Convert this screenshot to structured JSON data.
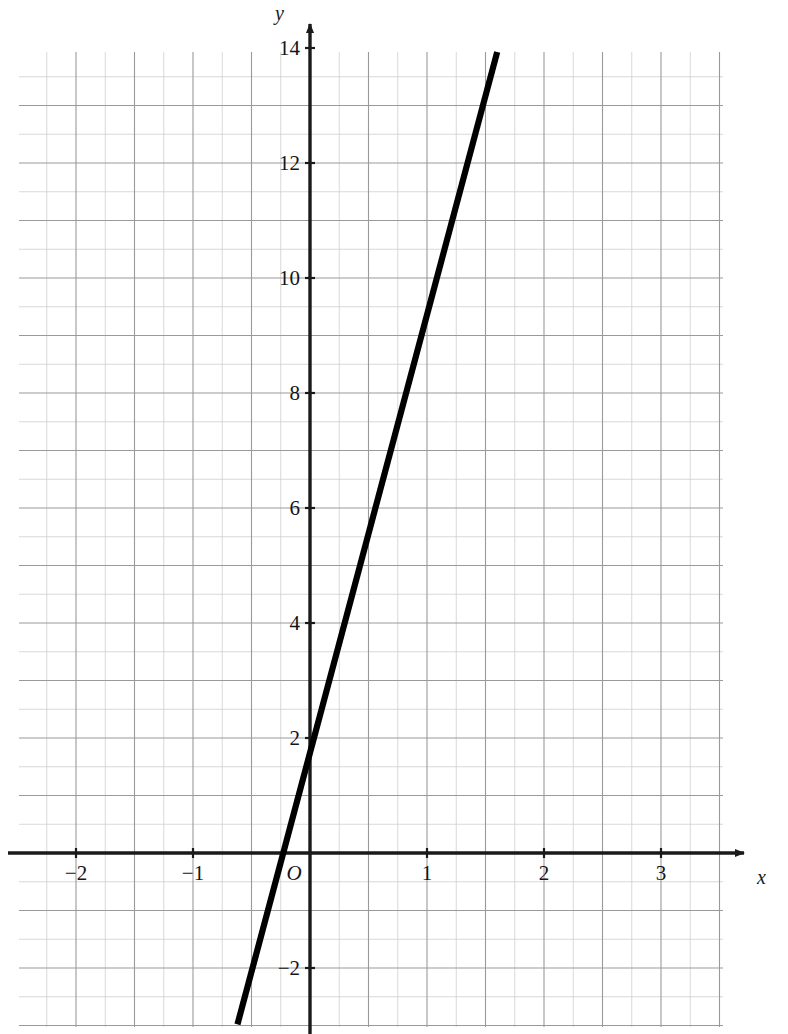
{
  "chart_data": {
    "type": "line",
    "title": "",
    "subtitle": "",
    "xlabel": "x",
    "ylabel": "y",
    "xlim": [
      -2.49,
      3.53
    ],
    "ylim": [
      -3.07,
      13.93
    ],
    "grid": true,
    "grid_major_step_x": 0.5,
    "grid_major_step_y": 1,
    "legend": "none",
    "x_ticks": [
      -2,
      -1,
      1,
      2,
      3
    ],
    "x_tick_labels": [
      "−2",
      "−1",
      "1",
      "2",
      "3"
    ],
    "y_ticks": [
      -2,
      2,
      4,
      6,
      8,
      10,
      12,
      14
    ],
    "y_tick_labels": [
      "−2",
      "2",
      "4",
      "6",
      "8",
      "10",
      "12",
      "14"
    ],
    "origin_label": "O",
    "series": [
      {
        "name": "straight line",
        "equation": "y = 8x + 2",
        "slope": 8,
        "intercept": 2,
        "color": "#000000",
        "points": [
          {
            "x": -0.62,
            "y": -2.98
          },
          {
            "x": 1.6,
            "y": 13.93
          }
        ],
        "key_points": [
          {
            "x": 0,
            "y": 2,
            "note": "y-intercept"
          },
          {
            "x": -0.25,
            "y": 0,
            "note": "x-intercept"
          },
          {
            "x": 1,
            "y": 10
          },
          {
            "x": 1.5,
            "y": 14
          }
        ]
      }
    ]
  },
  "axes": {
    "x_axis_name": "x",
    "y_axis_name": "y",
    "origin_label": "O"
  },
  "ticks": {
    "x": [
      {
        "label": "−2",
        "value": -2
      },
      {
        "label": "−1",
        "value": -1
      },
      {
        "label": "1",
        "value": 1
      },
      {
        "label": "2",
        "value": 2
      },
      {
        "label": "3",
        "value": 3
      }
    ],
    "y": [
      {
        "label": "14",
        "value": 14
      },
      {
        "label": "12",
        "value": 12
      },
      {
        "label": "10",
        "value": 10
      },
      {
        "label": "8",
        "value": 8
      },
      {
        "label": "6",
        "value": 6
      },
      {
        "label": "4",
        "value": 4
      },
      {
        "label": "2",
        "value": 2
      },
      {
        "label": "−2",
        "value": -2
      }
    ]
  },
  "style": {
    "line_color": "#000000",
    "axis_color": "#1a1a1a",
    "grid_major_color": "#9a9a9a",
    "grid_minor_color": "#cfcfcf",
    "background": "#ffffff"
  },
  "geometry": {
    "origin_px": {
      "x": 310,
      "y": 853
    },
    "unit_px": {
      "x": 117,
      "y": 57.5
    },
    "plot_rect_px": {
      "left": 19,
      "top": 52,
      "right": 723,
      "bottom": 1027
    }
  }
}
